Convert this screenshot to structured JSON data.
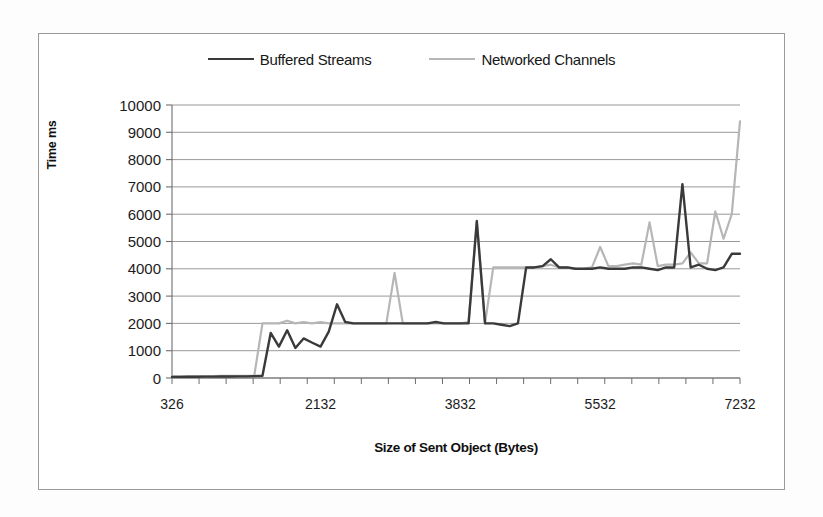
{
  "figure": {
    "frame_border_color": "#9a9a9a",
    "background": "#ffffff"
  },
  "legend": {
    "position": "top-center",
    "entries": [
      {
        "label": "Buffered Streams",
        "color": "#3a3a3a",
        "swatch_name": "legend-line-buffered-streams"
      },
      {
        "label": "Networked Channels",
        "color": "#b6b6b6",
        "swatch_name": "legend-line-networked-channels"
      }
    ]
  },
  "axes": {
    "y_title": "Time ms",
    "x_title": "Size of Sent Object (Bytes)",
    "y_ticks": [
      "10000",
      "9000",
      "8000",
      "7000",
      "6000",
      "5000",
      "4000",
      "3000",
      "2000",
      "1000",
      "0"
    ],
    "x_ticks": [
      "326",
      "2132",
      "3832",
      "5532",
      "7232"
    ]
  },
  "chart_data": {
    "type": "line",
    "title": "",
    "subtitle": "",
    "xlabel": "Size of Sent Object (Bytes)",
    "ylabel": "Time ms",
    "xlim": [
      326,
      7232
    ],
    "ylim": [
      0,
      10000
    ],
    "ytick_values": [
      0,
      1000,
      2000,
      3000,
      4000,
      5000,
      6000,
      7000,
      8000,
      9000,
      10000
    ],
    "xtick_values": [
      326,
      2132,
      3832,
      5532,
      7232
    ],
    "grid": true,
    "grid_axis": "y",
    "legend_position": "top-center",
    "x": [
      326,
      426,
      526,
      626,
      726,
      826,
      926,
      1026,
      1126,
      1226,
      1326,
      1426,
      1526,
      1626,
      1726,
      1826,
      1926,
      2026,
      2132,
      2232,
      2332,
      2432,
      2532,
      2632,
      2732,
      2832,
      2932,
      3032,
      3132,
      3232,
      3332,
      3432,
      3532,
      3632,
      3732,
      3832,
      3932,
      4032,
      4132,
      4232,
      4332,
      4432,
      4532,
      4632,
      4732,
      4832,
      4932,
      5032,
      5132,
      5232,
      5332,
      5432,
      5532,
      5632,
      5732,
      5832,
      5932,
      6032,
      6132,
      6232,
      6332,
      6432,
      6532,
      6632,
      6732,
      6832,
      6932,
      7032,
      7132,
      7232
    ],
    "series": [
      {
        "name": "Buffered Streams",
        "color": "#3a3a3a",
        "width": 2.4,
        "values": [
          40,
          40,
          45,
          45,
          50,
          50,
          55,
          55,
          60,
          60,
          70,
          80,
          1650,
          1150,
          1750,
          1100,
          1450,
          1300,
          1150,
          1700,
          2700,
          2050,
          2000,
          2000,
          2000,
          2000,
          2000,
          2000,
          2000,
          2000,
          2000,
          2000,
          2050,
          2000,
          2000,
          2000,
          2000,
          5750,
          2000,
          2000,
          1950,
          1900,
          2000,
          4050,
          4050,
          4100,
          4350,
          4050,
          4050,
          4000,
          4000,
          4000,
          4050,
          4000,
          4000,
          4000,
          4050,
          4050,
          4000,
          3950,
          4050,
          4050,
          7100,
          4050,
          4150,
          4000,
          3950,
          4050,
          4550,
          4550
        ]
      },
      {
        "name": "Networked Channels",
        "color": "#b6b6b6",
        "width": 2.2,
        "values": [
          60,
          60,
          65,
          65,
          70,
          70,
          75,
          75,
          80,
          80,
          85,
          2000,
          2000,
          2000,
          2100,
          2000,
          2050,
          2000,
          2050,
          2000,
          2000,
          2000,
          2000,
          2000,
          2000,
          2000,
          2000,
          3850,
          2000,
          2000,
          2000,
          2000,
          2000,
          2000,
          2000,
          2000,
          2050,
          5700,
          2000,
          4050,
          4050,
          4050,
          4050,
          4050,
          4050,
          4100,
          4150,
          4050,
          4050,
          4000,
          4000,
          4050,
          4800,
          4100,
          4100,
          4150,
          4200,
          4150,
          5700,
          4100,
          4150,
          4150,
          4200,
          4600,
          4200,
          4200,
          6100,
          5100,
          6000,
          9400
        ]
      }
    ]
  }
}
